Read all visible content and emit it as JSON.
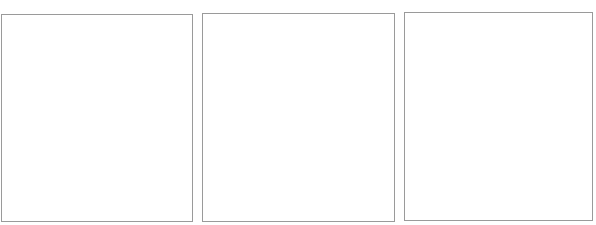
{
  "layout": {
    "panel_count": 3,
    "border_color": "#9a9a9a",
    "background_color": "#ffffff"
  },
  "panels": [
    {
      "id": "panel-1",
      "content": ""
    },
    {
      "id": "panel-2",
      "content": ""
    },
    {
      "id": "panel-3",
      "content": ""
    }
  ]
}
